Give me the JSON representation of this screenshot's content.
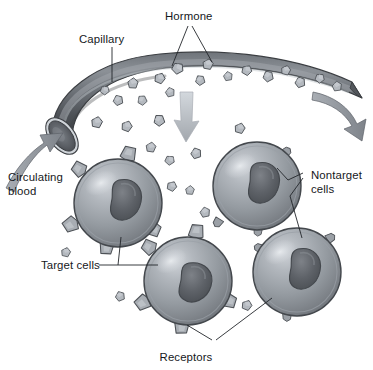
{
  "diagram": {
    "background_color": "#ffffff",
    "width": 373,
    "height": 370
  },
  "labels": {
    "hormone": "Hormone",
    "capillary": "Capillary",
    "circulating_line1": "Circulating",
    "circulating_line2": "blood",
    "nontarget_line1": "Nontarget",
    "nontarget_line2": "cells",
    "target_cells": "Target cells",
    "receptors": "Receptors"
  },
  "colors": {
    "background": "#ffffff",
    "text": "#15181c",
    "leader_line": "#23262a",
    "capillary_dark": "#4a4d52",
    "capillary_mid": "#6e7278",
    "capillary_light": "#9aa0a6",
    "capillary_rim": "#c8cdd2",
    "capillary_lumen": "#5b5f65",
    "cell_fill_light": "#b9bec4",
    "cell_fill_mid": "#8d9298",
    "cell_fill_dark": "#6b7076",
    "cell_outline": "#44484d",
    "nucleus_dark": "#4e5257",
    "nucleus_mid": "#6a6e74",
    "receptor_fill": "#a8adb3",
    "receptor_outline": "#4d5156",
    "hormone_fill": "#b4b9bf",
    "hormone_outline": "#4a4e53",
    "arrow_gray": "#8f949a",
    "arrow_light": "#c2c7cc"
  },
  "capillary": {
    "name": "capillary-vessel",
    "description": "Curved arched blood vessel running across the top, open lumen at lower left end",
    "hormone_particle_count": 17
  },
  "arrows": [
    {
      "name": "blood-inflow-arrow",
      "direction": "up-right",
      "position": "lower-left, entering capillary lumen",
      "meaning": "circulating blood enters"
    },
    {
      "name": "blood-outflow-arrow",
      "direction": "down-right",
      "position": "right end of capillary",
      "meaning": "blood continues onward"
    },
    {
      "name": "hormone-diffusion-arrow",
      "direction": "down",
      "position": "center below capillary",
      "meaning": "hormone diffuses to tissue"
    }
  ],
  "cells": [
    {
      "id": "cell-1",
      "name": "target-cell-left",
      "type": "target",
      "cx": 118,
      "cy": 203,
      "r": 44,
      "has_receptors": true,
      "receptor_count": 5
    },
    {
      "id": "cell-2",
      "name": "nontarget-cell-upper-right",
      "type": "nontarget",
      "cx": 257,
      "cy": 186,
      "r": 44,
      "has_receptors": false,
      "receptor_count": 0
    },
    {
      "id": "cell-3",
      "name": "target-cell-bottom-center",
      "type": "target",
      "cx": 188,
      "cy": 281,
      "r": 44,
      "has_receptors": true,
      "receptor_count": 5
    },
    {
      "id": "cell-4",
      "name": "nontarget-cell-bottom-right",
      "type": "nontarget",
      "cx": 297,
      "cy": 272,
      "r": 44,
      "has_receptors": false,
      "receptor_count": 0
    }
  ],
  "legend_notes": {
    "target_cells_have": "membrane receptors that bind hormone",
    "nontarget_cells_have": "no matching receptors, hormone passes by"
  }
}
